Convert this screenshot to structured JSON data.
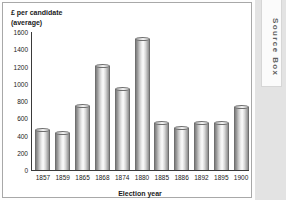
{
  "source_box": {
    "label": "Source Box"
  },
  "chart_data": {
    "type": "bar",
    "title": "",
    "subtitle": "",
    "ylabel": "£ per candidate\n(average)",
    "ylabel_line1": "£ per candidate",
    "ylabel_line2": "(average)",
    "xlabel": "Election year",
    "categories": [
      "1857",
      "1859",
      "1865",
      "1868",
      "1874",
      "1880",
      "1885",
      "1886",
      "1892",
      "1895",
      "1900"
    ],
    "values": [
      460,
      430,
      740,
      1210,
      940,
      1520,
      540,
      490,
      540,
      550,
      730
    ],
    "ylim": [
      0,
      1600
    ],
    "yticks": [
      0,
      200,
      400,
      600,
      800,
      1000,
      1200,
      1400,
      1600
    ],
    "ytick_labels": [
      "0",
      "200",
      "400",
      "600",
      "800",
      "1000",
      "1200",
      "1400",
      "1600"
    ],
    "grid": false,
    "legend": null,
    "bar_style": "3d-cylinder-grayscale",
    "bar_color": "#c9c9c9",
    "axis_color": "#3a3a3a"
  }
}
